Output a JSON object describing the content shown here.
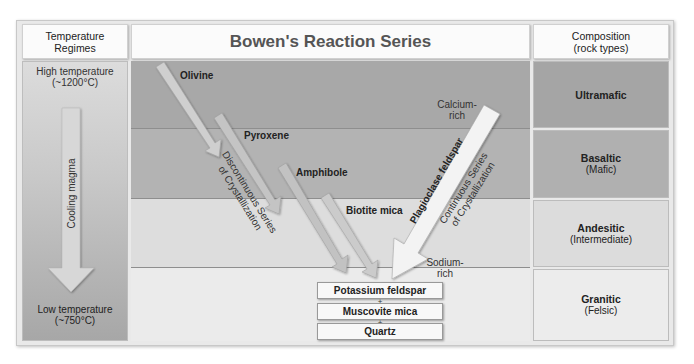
{
  "header": {
    "left": "Temperature\nRegimes",
    "left_line1": "Temperature",
    "left_line2": "Regimes",
    "title": "Bowen's Reaction Series",
    "right_line1": "Composition",
    "right_line2": "(rock types)"
  },
  "temperature": {
    "high_line1": "High temperature",
    "high_line2": "(~1200°C)",
    "low_line1": "Low temperature",
    "low_line2": "(~750°C)",
    "arrow_label": "Cooling magma"
  },
  "discontinuous": {
    "minerals": [
      "Olivine",
      "Pyroxene",
      "Amphibole",
      "Biotite mica"
    ],
    "label_line1": "Discontinuous Series",
    "label_line2": "of Crystallization"
  },
  "continuous": {
    "mineral": "Plagioclase feldspar",
    "label_line1": "Continuous Series",
    "label_line2": "of Crystallization",
    "top_note_line1": "Calcium-",
    "top_note_line2": "rich",
    "bottom_note_line1": "Sodium-",
    "bottom_note_line2": "rich"
  },
  "final_minerals": [
    "Potassium feldspar",
    "Muscovite mica",
    "Quartz"
  ],
  "plus_sign": "+",
  "compositions": [
    {
      "name": "Ultramafic",
      "sub": ""
    },
    {
      "name": "Basaltic",
      "sub": "(Mafic)"
    },
    {
      "name": "Andesitic",
      "sub": "(Intermediate)"
    },
    {
      "name": "Granitic",
      "sub": "(Felsic)"
    }
  ],
  "colors": {
    "band_ultramafic": "#a9a9a9",
    "band_basaltic": "#b4b4b4",
    "band_andesitic": "#dedede",
    "band_granitic": "#ebebeb",
    "arrow_fill": "#d2d2d2",
    "plag_arrow": "#f2f2f2"
  }
}
